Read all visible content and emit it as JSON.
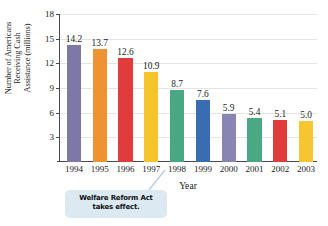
{
  "chart_data": {
    "type": "bar",
    "title": "",
    "xlabel": "Year",
    "ylabel": "Number of Americans Receiving Cash Assistance (millions)",
    "ylabel_lines": [
      "Number of Americans",
      "Receiving Cash",
      "Assistance (millions)"
    ],
    "categories": [
      "1994",
      "1995",
      "1996",
      "1997",
      "1998",
      "1999",
      "2000",
      "2001",
      "2002",
      "2003"
    ],
    "values": [
      14.2,
      13.7,
      12.6,
      10.9,
      8.7,
      7.6,
      5.9,
      5.4,
      5.1,
      5.0
    ],
    "value_labels": [
      "14.2",
      "13.7",
      "12.6",
      "10.9",
      "8.7",
      "7.6",
      "5.9",
      "5.4",
      "5.1",
      "5.0"
    ],
    "bar_colors": [
      "#7e78a6",
      "#ef9231",
      "#e03c3b",
      "#f6c42c",
      "#49a883",
      "#3a6cb2",
      "#8a84b4",
      "#4aa884",
      "#e03c3b",
      "#f5c532"
    ],
    "yticks": [
      3,
      6,
      9,
      12,
      15,
      18
    ],
    "ytick_labels": [
      "3",
      "6",
      "9",
      "12",
      "15",
      "18"
    ],
    "ylim": [
      0,
      18
    ],
    "grid": true,
    "legend": "none",
    "annotations": [
      {
        "id": "welfare-reform",
        "lines": [
          "Welfare Reform Act",
          "takes effect."
        ],
        "text": "Welfare Reform Act takes effect.",
        "points_to": "1997",
        "background": "#dbe9f2"
      }
    ]
  },
  "colors": {
    "axis": "#4a4a4a",
    "grid": "#e3e3e3",
    "text": "#1b1b1b",
    "callout_bg": "#dbe9f2"
  }
}
